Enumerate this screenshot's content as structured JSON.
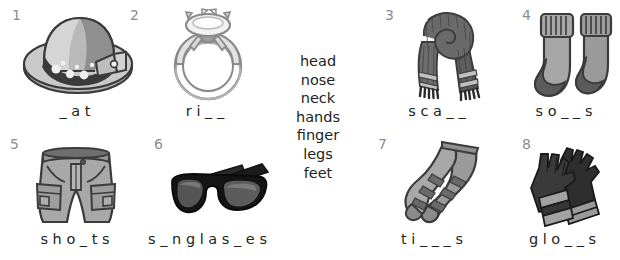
{
  "worksheet": {
    "background": "#ffffff",
    "number_color": "#8c8c8c",
    "text_color": "#231f20"
  },
  "wordbank": {
    "name": "body-parts-word-bank",
    "words": [
      "head",
      "nose",
      "neck",
      "hands",
      "finger",
      "legs",
      "feet"
    ]
  },
  "items": [
    {
      "number": "1",
      "icon": "hat-icon",
      "picture": "sun hat with patterned band and bow",
      "answer": "_ a t"
    },
    {
      "number": "2",
      "icon": "ring-icon",
      "picture": "diamond solitaire ring",
      "answer": "r i _ _"
    },
    {
      "number": "3",
      "icon": "scarf-icon",
      "picture": "striped scarf with fringe",
      "answer": "s c a _ _"
    },
    {
      "number": "4",
      "icon": "socks-icon",
      "picture": "pair of ribbed socks",
      "answer": "s o _ _ s"
    },
    {
      "number": "5",
      "icon": "shorts-icon",
      "picture": "cargo shorts",
      "answer": "s h o _ t s"
    },
    {
      "number": "6",
      "icon": "sunglasses-icon",
      "picture": "black sunglasses",
      "answer": "s _ n g l a s _ e s"
    },
    {
      "number": "7",
      "icon": "tights-icon",
      "picture": "striped tights",
      "answer": "t i _ _ _ s"
    },
    {
      "number": "8",
      "icon": "gloves-icon",
      "picture": "pair of striped gloves",
      "answer": "g l o _ _ s"
    }
  ]
}
